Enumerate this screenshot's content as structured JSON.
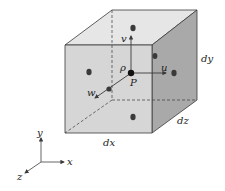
{
  "diagram": {
    "cube": {
      "colors": {
        "front": "#d6d6d6",
        "top": "#e6e6e6",
        "side": "#a9a9a9",
        "edge": "#3a3a3a",
        "dot": "#3a3a3a"
      }
    },
    "labels": {
      "v": "v",
      "u": "u",
      "w": "w",
      "rho": "ρ",
      "P": "P",
      "dx": "dx",
      "dy": "dy",
      "dz": "dz"
    },
    "axes": {
      "x": "x",
      "y": "y",
      "z": "z"
    }
  }
}
